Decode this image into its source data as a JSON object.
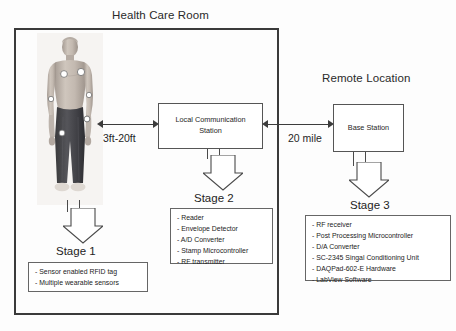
{
  "diagram": {
    "room": {
      "title": "Health Care Room"
    },
    "remote": {
      "title": "Remote Location"
    },
    "nodes": {
      "local_communication_station": {
        "line1": "Local Communication",
        "line2": "Station"
      },
      "base_station": {
        "label": "Base Station"
      }
    },
    "links": [
      {
        "id": "person-to-lcs",
        "label": "3ft-20ft",
        "style": "double-headed-arrow"
      },
      {
        "id": "lcs-to-base-station",
        "label": "20 mile",
        "style": "double-headed-arrow"
      }
    ],
    "stages": [
      {
        "id": "stage1",
        "caption": "Stage 1",
        "items": [
          "Sensor enabled RFID tag",
          "Multiple wearable sensors"
        ]
      },
      {
        "id": "stage2",
        "caption": "Stage 2",
        "items": [
          "Reader",
          "Envelope Detector",
          "A/D Converter",
          "Stamp Microcontroller",
          "RF transmitter"
        ]
      },
      {
        "id": "stage3",
        "caption": "Stage 3",
        "items": [
          "RF receiver",
          "Post Processing Microcontroller",
          "D/A Converter",
          "SC-2345 Singal Conditioning Unit",
          "DAQPad-602-E Hardware",
          "LabView Software"
        ]
      }
    ],
    "figure": {
      "name": "patient-with-wearable-sensors",
      "sensor_count": 6
    },
    "colors": {
      "room_border": "#3a3a3a",
      "box_border": "#555555",
      "arrow": "#3c3c3c",
      "text": "#232323",
      "background": "#fdfdfd"
    }
  }
}
